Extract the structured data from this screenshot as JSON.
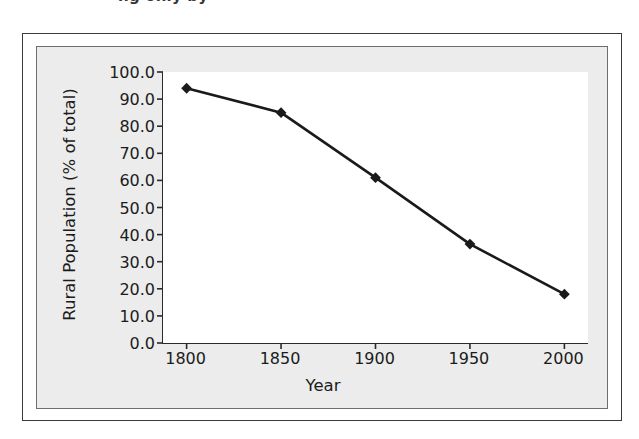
{
  "page": {
    "top_text_remnant": "ng only by"
  },
  "figure": {
    "background": "#ececec",
    "plot_background": "#ffffff",
    "axis_color": "#2a2a2a",
    "series_color": "#1a1a1a"
  },
  "chart_data": {
    "type": "line",
    "title": "",
    "subtitle": "",
    "xlabel": "Year",
    "ylabel": "Rural Population (% of total)",
    "x": [
      1800,
      1850,
      1900,
      1950,
      2000
    ],
    "xtick_labels": [
      "1800",
      "1850",
      "1900",
      "1950",
      "2000"
    ],
    "ytick_labels": [
      "100.0",
      "90.0",
      "80.0",
      "70.0",
      "60.0",
      "50.0",
      "40.0",
      "30.0",
      "20.0",
      "10.0",
      "0.0"
    ],
    "ytick_values": [
      100,
      90,
      80,
      70,
      60,
      50,
      40,
      30,
      20,
      10,
      0
    ],
    "values": [
      94,
      85,
      61,
      36.5,
      18
    ],
    "series": [
      {
        "name": "Rural Population (% of total)",
        "values": [
          94,
          85,
          61,
          36.5,
          18
        ],
        "marker": "diamond",
        "color": "#1a1a1a"
      }
    ],
    "xlim": [
      1787.5,
      2012.5
    ],
    "ylim": [
      0,
      100
    ],
    "grid": false,
    "legend": "none"
  }
}
